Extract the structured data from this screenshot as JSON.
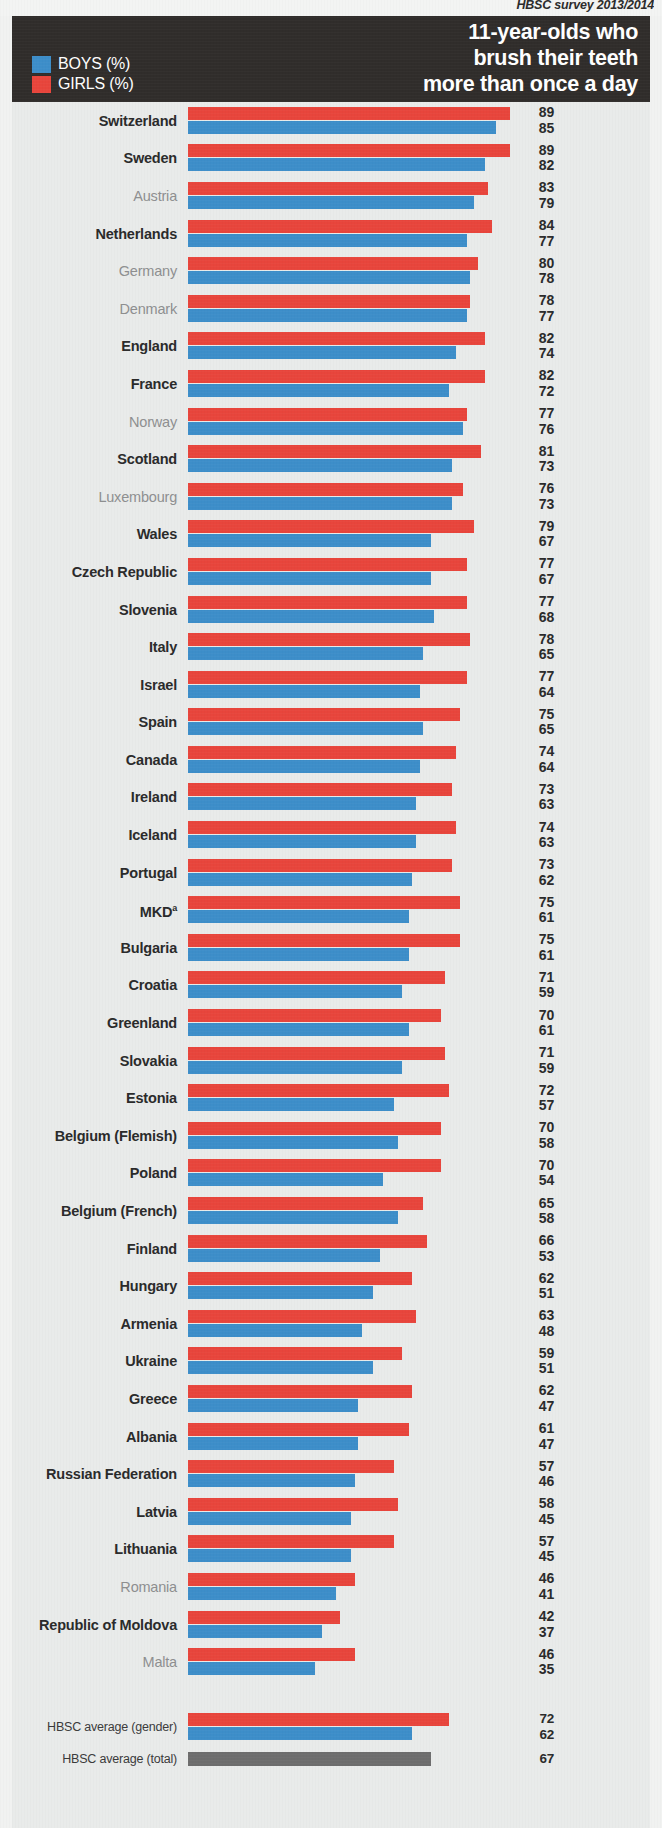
{
  "source": {
    "text": "HBSC survey 2013/2014"
  },
  "header": {
    "title_line1": "11-year-olds who",
    "title_line2": "brush their teeth",
    "title_line3": "more than once a day",
    "legend": [
      {
        "key": "boys",
        "label": "BOYS (%)",
        "color": "#3d8ec9"
      },
      {
        "key": "girls",
        "label": "GIRLS (%)",
        "color": "#e8453c"
      }
    ]
  },
  "footnote_marker": "a",
  "chart_data": {
    "type": "bar",
    "orientation": "horizontal",
    "title": "11-year-olds who brush their teeth more than once a day",
    "subtitle": "HBSC survey 2013/2014",
    "xlabel": "%",
    "ylabel": "",
    "xlim": [
      0,
      100
    ],
    "grid": false,
    "legend_position": "top-left",
    "series": [
      {
        "name": "GIRLS (%)",
        "color": "#e8453c",
        "values": [
          89,
          89,
          83,
          84,
          80,
          78,
          82,
          82,
          77,
          81,
          76,
          79,
          77,
          77,
          78,
          77,
          75,
          74,
          73,
          74,
          73,
          75,
          75,
          71,
          70,
          71,
          72,
          70,
          70,
          65,
          66,
          62,
          63,
          59,
          62,
          61,
          57,
          58,
          57,
          46,
          42,
          46
        ]
      },
      {
        "name": "BOYS (%)",
        "color": "#3d8ec9",
        "values": [
          85,
          82,
          79,
          77,
          78,
          77,
          74,
          72,
          76,
          73,
          73,
          67,
          67,
          68,
          65,
          64,
          65,
          64,
          63,
          63,
          62,
          61,
          61,
          59,
          61,
          59,
          57,
          58,
          54,
          58,
          53,
          51,
          48,
          51,
          47,
          47,
          46,
          45,
          45,
          41,
          37,
          35
        ]
      }
    ],
    "categories": [
      "Switzerland",
      "Sweden",
      "Austria",
      "Netherlands",
      "Germany",
      "Denmark",
      "England",
      "France",
      "Norway",
      "Scotland",
      "Luxembourg",
      "Wales",
      "Czech Republic",
      "Slovenia",
      "Italy",
      "Israel",
      "Spain",
      "Canada",
      "Ireland",
      "Iceland",
      "Portugal",
      "MKD",
      "Bulgaria",
      "Croatia",
      "Greenland",
      "Slovakia",
      "Estonia",
      "Belgium (Flemish)",
      "Poland",
      "Belgium (French)",
      "Finland",
      "Hungary",
      "Armenia",
      "Ukraine",
      "Greece",
      "Albania",
      "Russian Federation",
      "Latvia",
      "Lithuania",
      "Romania",
      "Republic of Moldova",
      "Malta"
    ],
    "averages": [
      {
        "label": "HBSC average (gender)",
        "girls": 72,
        "boys": 62
      },
      {
        "label": "HBSC average (total)",
        "total": 67,
        "color": "#6d6d6d"
      }
    ]
  },
  "rows": [
    {
      "name": "Switzerland",
      "emphasis": "hi",
      "girls": 89,
      "boys": 85
    },
    {
      "name": "Sweden",
      "emphasis": "hi",
      "girls": 89,
      "boys": 82
    },
    {
      "name": "Austria",
      "emphasis": "lo",
      "girls": 83,
      "boys": 79
    },
    {
      "name": "Netherlands",
      "emphasis": "hi",
      "girls": 84,
      "boys": 77
    },
    {
      "name": "Germany",
      "emphasis": "lo",
      "girls": 80,
      "boys": 78
    },
    {
      "name": "Denmark",
      "emphasis": "lo",
      "girls": 78,
      "boys": 77
    },
    {
      "name": "England",
      "emphasis": "hi",
      "girls": 82,
      "boys": 74
    },
    {
      "name": "France",
      "emphasis": "hi",
      "girls": 82,
      "boys": 72
    },
    {
      "name": "Norway",
      "emphasis": "lo",
      "girls": 77,
      "boys": 76
    },
    {
      "name": "Scotland",
      "emphasis": "hi",
      "girls": 81,
      "boys": 73
    },
    {
      "name": "Luxembourg",
      "emphasis": "lo",
      "girls": 76,
      "boys": 73
    },
    {
      "name": "Wales",
      "emphasis": "hi",
      "girls": 79,
      "boys": 67
    },
    {
      "name": "Czech Republic",
      "emphasis": "hi",
      "girls": 77,
      "boys": 67
    },
    {
      "name": "Slovenia",
      "emphasis": "hi",
      "girls": 77,
      "boys": 68
    },
    {
      "name": "Italy",
      "emphasis": "hi",
      "girls": 78,
      "boys": 65
    },
    {
      "name": "Israel",
      "emphasis": "hi",
      "girls": 77,
      "boys": 64
    },
    {
      "name": "Spain",
      "emphasis": "hi",
      "girls": 75,
      "boys": 65
    },
    {
      "name": "Canada",
      "emphasis": "hi",
      "girls": 74,
      "boys": 64
    },
    {
      "name": "Ireland",
      "emphasis": "hi",
      "girls": 73,
      "boys": 63
    },
    {
      "name": "Iceland",
      "emphasis": "hi",
      "girls": 74,
      "boys": 63
    },
    {
      "name": "Portugal",
      "emphasis": "hi",
      "girls": 73,
      "boys": 62
    },
    {
      "name": "MKD",
      "emphasis": "hi",
      "girls": 75,
      "boys": 61,
      "sup": "a"
    },
    {
      "name": "Bulgaria",
      "emphasis": "hi",
      "girls": 75,
      "boys": 61
    },
    {
      "name": "Croatia",
      "emphasis": "hi",
      "girls": 71,
      "boys": 59
    },
    {
      "name": "Greenland",
      "emphasis": "hi",
      "girls": 70,
      "boys": 61
    },
    {
      "name": "Slovakia",
      "emphasis": "hi",
      "girls": 71,
      "boys": 59
    },
    {
      "name": "Estonia",
      "emphasis": "hi",
      "girls": 72,
      "boys": 57
    },
    {
      "name": "Belgium (Flemish)",
      "emphasis": "hi",
      "girls": 70,
      "boys": 58
    },
    {
      "name": "Poland",
      "emphasis": "hi",
      "girls": 70,
      "boys": 54
    },
    {
      "name": "Belgium (French)",
      "emphasis": "hi",
      "girls": 65,
      "boys": 58
    },
    {
      "name": "Finland",
      "emphasis": "hi",
      "girls": 66,
      "boys": 53
    },
    {
      "name": "Hungary",
      "emphasis": "hi",
      "girls": 62,
      "boys": 51
    },
    {
      "name": "Armenia",
      "emphasis": "hi",
      "girls": 63,
      "boys": 48
    },
    {
      "name": "Ukraine",
      "emphasis": "hi",
      "girls": 59,
      "boys": 51
    },
    {
      "name": "Greece",
      "emphasis": "hi",
      "girls": 62,
      "boys": 47
    },
    {
      "name": "Albania",
      "emphasis": "hi",
      "girls": 61,
      "boys": 47
    },
    {
      "name": "Russian Federation",
      "emphasis": "hi",
      "girls": 57,
      "boys": 46
    },
    {
      "name": "Latvia",
      "emphasis": "hi",
      "girls": 58,
      "boys": 45
    },
    {
      "name": "Lithuania",
      "emphasis": "hi",
      "girls": 57,
      "boys": 45
    },
    {
      "name": "Romania",
      "emphasis": "lo",
      "girls": 46,
      "boys": 41
    },
    {
      "name": "Republic of Moldova",
      "emphasis": "hi",
      "girls": 42,
      "boys": 37
    },
    {
      "name": "Malta",
      "emphasis": "lo",
      "girls": 46,
      "boys": 35
    }
  ],
  "averages": [
    {
      "name": "HBSC average (gender)",
      "girls": 72,
      "boys": 62
    },
    {
      "name": "HBSC average (total)",
      "total": 67
    }
  ]
}
